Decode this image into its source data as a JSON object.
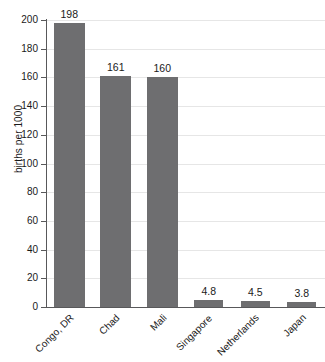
{
  "chart_data": {
    "type": "bar",
    "title": "",
    "xlabel": "",
    "ylabel": "births per 1000",
    "categories": [
      "Congo, DR",
      "Chad",
      "Mali",
      "Singapore",
      "Netherlands",
      "Japan"
    ],
    "values": [
      198,
      161,
      160,
      4.8,
      4.5,
      3.8
    ],
    "value_labels": [
      "198",
      "161",
      "160",
      "4.8",
      "4.5",
      "3.8"
    ],
    "ylim": [
      0,
      200
    ],
    "ytick_step": 20,
    "yticks": [
      0,
      20,
      40,
      60,
      80,
      100,
      120,
      140,
      160,
      180,
      200
    ],
    "ytick_labels": [
      "0",
      "20",
      "40",
      "60",
      "80",
      "100",
      "120",
      "140",
      "160",
      "180",
      "200"
    ],
    "grid": true,
    "grid_axis": "y",
    "legend": false,
    "legend_position": "none",
    "bar_color": "#6e6e70",
    "grid_color": "#e6e6e6",
    "axis_color": "#58585a",
    "background_color": "#ffffff",
    "text_color": "#1a1a1a",
    "category_label_rotation": -45
  }
}
